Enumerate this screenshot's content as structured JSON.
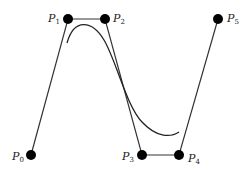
{
  "diagram": {
    "type": "bezier-control-polygon",
    "points": [
      {
        "id": "P0",
        "base": "P",
        "sub": "0",
        "x": 31,
        "y": 155,
        "lx": 12,
        "ly": 160
      },
      {
        "id": "P1",
        "base": "P",
        "sub": "1",
        "x": 68,
        "y": 19,
        "lx": 48,
        "ly": 22
      },
      {
        "id": "P2",
        "base": "P",
        "sub": "2",
        "x": 105,
        "y": 19,
        "lx": 113,
        "ly": 22
      },
      {
        "id": "P3",
        "base": "P",
        "sub": "3",
        "x": 142,
        "y": 155,
        "lx": 122,
        "ly": 160
      },
      {
        "id": "P4",
        "base": "P",
        "sub": "4",
        "x": 179,
        "y": 155,
        "lx": 188,
        "ly": 162
      },
      {
        "id": "P5",
        "base": "P",
        "sub": "5",
        "x": 218,
        "y": 19,
        "lx": 227,
        "ly": 22
      }
    ],
    "curve": {
      "start": [
        67,
        43
      ],
      "end": [
        179,
        132
      ]
    },
    "colors": {
      "line": "#111111",
      "point": "#000000"
    }
  }
}
